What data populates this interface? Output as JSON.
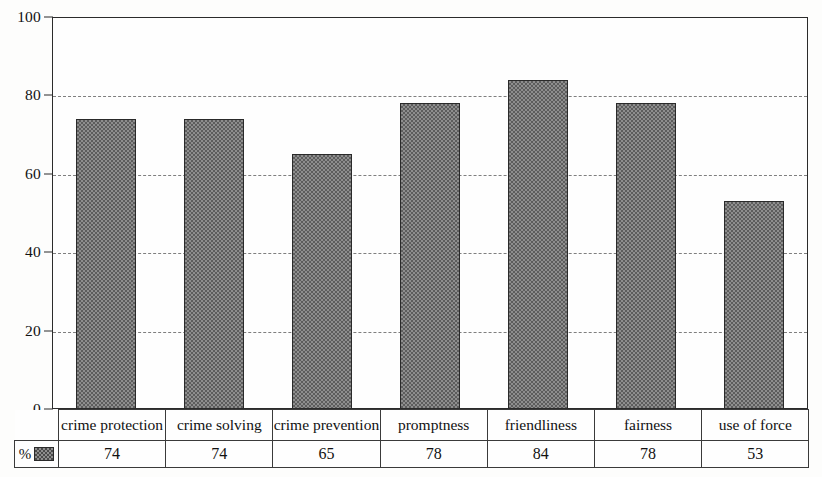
{
  "chart_data": {
    "type": "bar",
    "title": "",
    "xlabel": "",
    "ylabel": "",
    "ylim": [
      0,
      100
    ],
    "yticks": [
      0,
      20,
      40,
      60,
      80,
      100
    ],
    "grid": true,
    "legend_position": "bottom-left",
    "series_name": "%",
    "categories": [
      "crime protection",
      "crime solving",
      "crime prevention",
      "promptness",
      "friendliness",
      "fairness",
      "use of force"
    ],
    "values": [
      74,
      74,
      65,
      78,
      84,
      78,
      53
    ],
    "value_labels": [
      "74",
      "74",
      "65",
      "78",
      "84",
      "78",
      "53"
    ],
    "value_label_small": [
      false,
      false,
      false,
      false,
      false,
      true,
      true
    ]
  },
  "axis": {
    "ytick_labels": [
      "100",
      "80",
      "60",
      "40",
      "20",
      "0"
    ]
  },
  "legend": {
    "percent_symbol": "%",
    "swatch_name": "checkered-gray-swatch"
  },
  "colors": {
    "bar_fill": "#8e8e8e",
    "bar_pattern": "#5d5d5d",
    "bar_outline": "#2a2a2a",
    "axis": "#2b2b2b",
    "gridline": "#6a6a6a",
    "text": "#111111",
    "background": "#fdfdfc"
  }
}
